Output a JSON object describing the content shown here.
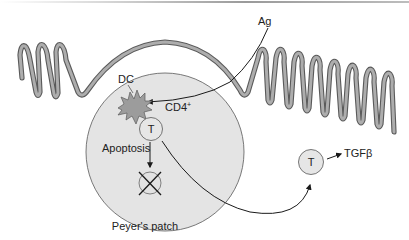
{
  "figure": {
    "colors": {
      "epithelium_fill": "#a9a9a9",
      "epithelium_outline": "#5a5a5a",
      "patch_fill": "#e4e4e4",
      "patch_outline": "#6a6a6a",
      "dc_fill": "#9c9c9c",
      "cell_fill": "#e6e6e6",
      "arrow": "#1a1a1a",
      "text": "#222222"
    }
  },
  "labels": {
    "antigen": "Ag",
    "dendritic_cell": "DC",
    "t_cell_marker": "CD4",
    "t_cell_marker_sup": "+",
    "t_cell_inside": "T",
    "apoptosis": "Apoptosis",
    "peyers_patch": "Peyer's patch",
    "migrated_t_cell": "T",
    "cytokine": "TGFβ"
  }
}
